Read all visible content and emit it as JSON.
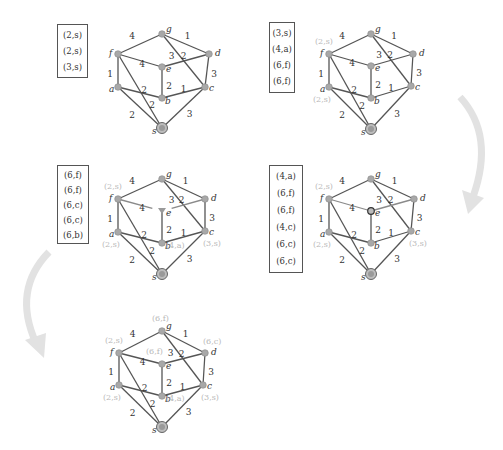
{
  "figure": {
    "colors": {
      "edge": "#555555",
      "node_fill": "#a8a8a8",
      "node_stroke": "#888888",
      "weight_text": "#333333",
      "node_label": "#333333",
      "dist_label": "#b8b8b8",
      "queue_border": "#555555",
      "arrow": "#e2e2e2"
    },
    "graph": {
      "nodes": [
        "g",
        "f",
        "d",
        "e",
        "a",
        "c",
        "b",
        "s"
      ],
      "edges": [
        {
          "u": "f",
          "v": "g",
          "w": "4"
        },
        {
          "u": "g",
          "v": "d",
          "w": "1"
        },
        {
          "u": "g",
          "v": "c",
          "w": "3"
        },
        {
          "u": "f",
          "v": "e",
          "w": "4"
        },
        {
          "u": "e",
          "v": "d",
          "w": "2"
        },
        {
          "u": "f",
          "v": "a",
          "w": "1"
        },
        {
          "u": "e",
          "v": "b",
          "w": "2"
        },
        {
          "u": "d",
          "v": "c",
          "w": "3"
        },
        {
          "u": "a",
          "v": "b",
          "w": "2"
        },
        {
          "u": "b",
          "v": "c",
          "w": "1"
        },
        {
          "u": "a",
          "v": "s",
          "w": "2"
        },
        {
          "u": "f",
          "v": "s",
          "w": "2"
        },
        {
          "u": "c",
          "v": "s",
          "w": "3"
        }
      ]
    },
    "panels": [
      {
        "id": "step-1",
        "queue": [
          "(2,s)",
          "(2,s)",
          "(3,s)"
        ],
        "distance_labels": [],
        "highlight_node": null
      },
      {
        "id": "step-2",
        "queue": [
          "(3,s)",
          "(4,a)",
          "(6,f)",
          "(6,f)"
        ],
        "distance_labels": [
          {
            "node": "f",
            "text": "(2,s)"
          },
          {
            "node": "a",
            "text": "(2,s)"
          }
        ],
        "highlight_node": null
      },
      {
        "id": "step-3",
        "queue": [
          "(6,f)",
          "(6,f)",
          "(6,c)",
          "(6,c)",
          "(6,b)"
        ],
        "distance_labels": [
          {
            "node": "f",
            "text": "(2,s)"
          },
          {
            "node": "a",
            "text": "(2,s)"
          },
          {
            "node": "b",
            "text": "(4,a)"
          },
          {
            "node": "c",
            "text": "(3,s)"
          }
        ],
        "highlight_node": "e-triangle"
      },
      {
        "id": "step-4",
        "queue": [
          "(4,a)",
          "(6,f)",
          "(6,f)",
          "(4,c)",
          "(6,c)",
          "(6,c)"
        ],
        "distance_labels": [
          {
            "node": "f",
            "text": "(2,s)"
          },
          {
            "node": "a",
            "text": "(2,s)"
          },
          {
            "node": "c",
            "text": "(3,s)"
          }
        ],
        "highlight_node": "e-ring"
      },
      {
        "id": "step-5",
        "queue": [],
        "distance_labels": [
          {
            "node": "g",
            "text": "(6,f)"
          },
          {
            "node": "f",
            "text": "(2,s)"
          },
          {
            "node": "e",
            "text": "(6,f)"
          },
          {
            "node": "d",
            "text": "(6,c)"
          },
          {
            "node": "a",
            "text": "(2,s)"
          },
          {
            "node": "b",
            "text": "(4,a)"
          },
          {
            "node": "c",
            "text": "(3,s)"
          }
        ],
        "highlight_node": null
      }
    ],
    "arrows": [
      {
        "id": "arrow-step2-to-step4",
        "direction": "down-curving-left"
      },
      {
        "id": "arrow-step3-to-step5",
        "direction": "down-curving-right"
      }
    ]
  }
}
